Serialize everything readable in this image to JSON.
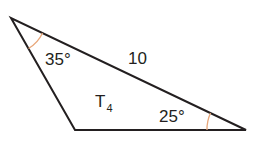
{
  "figure": {
    "shape": "triangle",
    "name": "T",
    "name_subscript": "4",
    "stroke_color": "#231f20",
    "arc_color": "#e8a77a",
    "vertices": {
      "top_left": [
        11,
        18
      ],
      "bottom_left": [
        75,
        130
      ],
      "right": [
        246,
        130
      ]
    },
    "angles": [
      {
        "vertex": "top_left",
        "label": "35°"
      },
      {
        "vertex": "right",
        "label": "25°"
      }
    ],
    "sides": [
      {
        "between": [
          "top_left",
          "right"
        ],
        "label": "10"
      }
    ]
  }
}
